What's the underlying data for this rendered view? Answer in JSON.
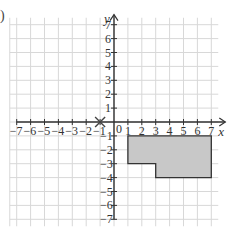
{
  "question_label": ")",
  "chart_data": {
    "type": "coordinate-grid",
    "title": "",
    "xlabel": "x",
    "ylabel": "y",
    "xlim": [
      -7,
      7
    ],
    "ylim": [
      -7,
      7
    ],
    "grid": true,
    "x_ticks": [
      -7,
      -6,
      -5,
      -4,
      -3,
      -2,
      -1,
      1,
      2,
      3,
      4,
      5,
      6,
      7
    ],
    "y_ticks": [
      -7,
      -6,
      -5,
      -4,
      -3,
      -2,
      -1,
      1,
      2,
      3,
      4,
      5,
      6,
      7
    ],
    "origin_label": "0",
    "marked_point": {
      "x": -1,
      "y": 0,
      "marker": "cross"
    },
    "shape": {
      "type": "polygon",
      "fill": "#c8c8c8",
      "stroke": "#333333",
      "vertices": [
        [
          1,
          -1
        ],
        [
          7,
          -1
        ],
        [
          7,
          -4
        ],
        [
          3,
          -4
        ],
        [
          3,
          -3
        ],
        [
          1,
          -3
        ]
      ]
    }
  },
  "colors": {
    "grid": "#d8d8d8",
    "axis": "#333333",
    "shape_fill": "#c8c8c8"
  }
}
